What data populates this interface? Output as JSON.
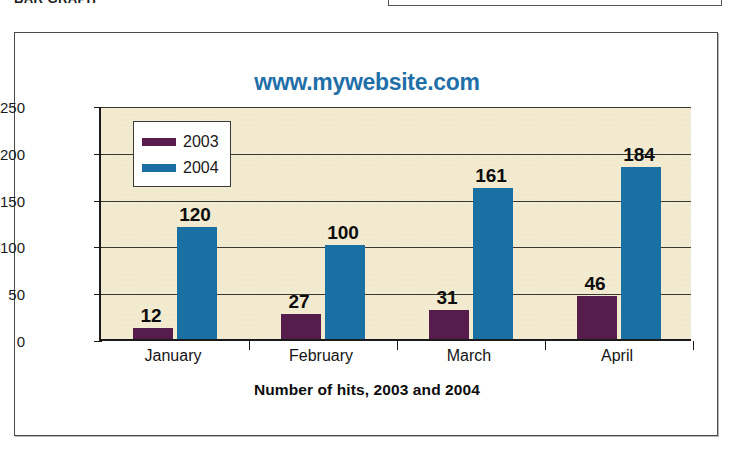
{
  "page": {
    "top_caption": "BAR GRAPH",
    "colors": {
      "series_2003": "#561c4b",
      "series_2004": "#1a6fa3",
      "title": "#1f6fa8",
      "plot_background": "#f2eacf",
      "axis": "#1a1a1a"
    }
  },
  "chart_data": {
    "type": "bar",
    "title": "www.mywebsite.com",
    "xlabel": "Number of hits, 2003 and 2004",
    "ylabel": "",
    "categories": [
      "January",
      "February",
      "March",
      "April"
    ],
    "series": [
      {
        "name": "2003",
        "color": "#561c4b",
        "values": [
          12,
          27,
          31,
          46
        ]
      },
      {
        "name": "2004",
        "color": "#1a6fa3",
        "values": [
          120,
          100,
          161,
          184
        ]
      }
    ],
    "ylim": [
      0,
      250
    ],
    "yticks": [
      0,
      50,
      100,
      150,
      200,
      250
    ],
    "grid": true,
    "legend_position": "top-left",
    "data_labels": true
  }
}
